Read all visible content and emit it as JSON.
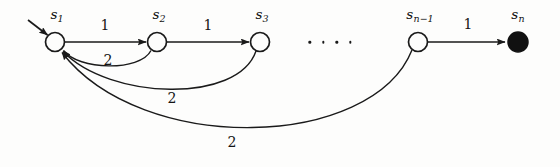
{
  "figure": {
    "background_color": "#fdfdfc",
    "stroke_color": "#1a1a1a",
    "width": 560,
    "height": 167
  },
  "nodes": [
    {
      "id": "s1",
      "label": "s",
      "subscript": "1",
      "x": 55,
      "y": 42,
      "r": 9.5,
      "filled": false,
      "label_x": 57,
      "label_y": 15
    },
    {
      "id": "s2",
      "label": "s",
      "subscript": "2",
      "x": 157,
      "y": 42,
      "r": 9.5,
      "filled": false,
      "label_x": 159,
      "label_y": 15
    },
    {
      "id": "s3",
      "label": "s",
      "subscript": "3",
      "x": 260,
      "y": 42,
      "r": 9.5,
      "filled": false,
      "label_x": 262,
      "label_y": 15
    },
    {
      "id": "sn1",
      "label": "s",
      "subscript": "n−1",
      "x": 418,
      "y": 42,
      "r": 9.5,
      "filled": false,
      "label_x": 420,
      "label_y": 15
    },
    {
      "id": "sn",
      "label": "s",
      "subscript": "n",
      "x": 518,
      "y": 42,
      "r": 10,
      "filled": true,
      "label_x": 518,
      "label_y": 15
    }
  ],
  "edges": [
    {
      "id": "start-arrow",
      "from": "",
      "to": "s1",
      "weight": "",
      "kind": "start"
    },
    {
      "id": "e-s1-s2",
      "from": "s1",
      "to": "s2",
      "weight": "1",
      "kind": "forward",
      "label_x": 105,
      "label_y": 25
    },
    {
      "id": "e-s2-s3",
      "from": "s2",
      "to": "s3",
      "weight": "1",
      "kind": "forward",
      "label_x": 208,
      "label_y": 25
    },
    {
      "id": "e-sn1-sn",
      "from": "sn1",
      "to": "sn",
      "weight": "1",
      "kind": "forward",
      "label_x": 468,
      "label_y": 24
    },
    {
      "id": "e-s2-s1",
      "from": "s2",
      "to": "s1",
      "weight": "2",
      "kind": "backward",
      "label_x": 108,
      "label_y": 60
    },
    {
      "id": "e-s3-s1",
      "from": "s3",
      "to": "s1",
      "weight": "2",
      "kind": "backward",
      "label_x": 172,
      "label_y": 98
    },
    {
      "id": "e-sn1-s1",
      "from": "sn1",
      "to": "s1",
      "weight": "2",
      "kind": "backward",
      "label_x": 232,
      "label_y": 142
    }
  ],
  "ellipsis": {
    "id": "state-ellipsis",
    "dots": 4,
    "x": 330,
    "y": 42
  }
}
